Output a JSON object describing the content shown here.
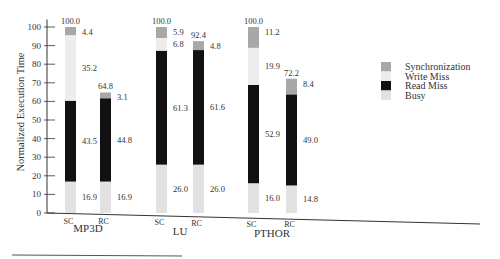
{
  "chart_data": {
    "type": "bar",
    "stacked": true,
    "title": "",
    "ylabel": "Normalized Execution Time",
    "xlabel": "",
    "ylim": [
      0,
      100
    ],
    "yticks": [
      0,
      10,
      20,
      30,
      40,
      50,
      60,
      70,
      80,
      90,
      100
    ],
    "groups": [
      "MP3D",
      "LU",
      "PTHOR"
    ],
    "categories": [
      "SC",
      "RC",
      "SC",
      "RC",
      "SC",
      "RC"
    ],
    "series": [
      {
        "name": "Busy",
        "color": "#e2e2e2",
        "values": [
          16.9,
          16.9,
          26.0,
          26.0,
          16.0,
          14.8
        ]
      },
      {
        "name": "Read Miss",
        "color": "#111111",
        "values": [
          43.5,
          44.8,
          61.3,
          61.6,
          52.9,
          49.0
        ]
      },
      {
        "name": "Write Miss",
        "color": "#ededed",
        "values": [
          35.2,
          0,
          6.8,
          0,
          19.9,
          0
        ]
      },
      {
        "name": "Synchronization",
        "color": "#a8a8a8",
        "values": [
          4.4,
          3.1,
          5.9,
          4.8,
          11.2,
          8.4
        ]
      }
    ],
    "totals": [
      "100.0",
      "64.8",
      "100.0",
      "92.4",
      "100.0",
      "72.2"
    ],
    "segment_labels": [
      {
        "busy": "16.9",
        "read": "43.5",
        "write": "35.2",
        "sync": "4.4"
      },
      {
        "busy": "16.9",
        "read": "44.8",
        "write": "",
        "sync": "3.1"
      },
      {
        "busy": "26.0",
        "read": "61.3",
        "write": "6.8",
        "sync": "5.9"
      },
      {
        "busy": "26.0",
        "read": "61.6",
        "write": "",
        "sync": "4.8"
      },
      {
        "busy": "16.0",
        "read": "52.9",
        "write": "19.9",
        "sync": "11.2"
      },
      {
        "busy": "14.8",
        "read": "49.0",
        "write": "",
        "sync": "8.4"
      }
    ],
    "legend": {
      "position": "right",
      "entries": [
        "Synchronization",
        "Write Miss",
        "Read Miss",
        "Busy"
      ]
    },
    "grid": false
  }
}
